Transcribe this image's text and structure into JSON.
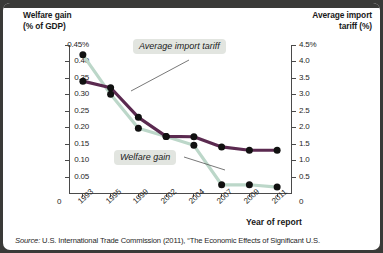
{
  "axes": {
    "left_title": "Welfare gain\n(% of GDP)",
    "left_title_line1": "Welfare gain",
    "left_title_line2": "(% of GDP)",
    "right_title_line1": "Average import",
    "right_title_line2": "tariff (%)",
    "x_title": "Year of report"
  },
  "callouts": {
    "tariff": "Average import tariff",
    "welfare": "Welfare gain"
  },
  "source": {
    "prefix": "Source:",
    "text": " U.S. International Trade Commission (2011), “The Economic Effects of Significant U.S."
  },
  "colors": {
    "tariff_line": "#5b2a50",
    "welfare_line": "#bcd7c9",
    "marker": "#111111",
    "axis": "#4a4a4a",
    "frame": "#3a3a38",
    "callout_bg": "#e2e5e0"
  },
  "chart_data": {
    "type": "line",
    "title": "",
    "xlabel": "Year of report",
    "ylabel": "Welfare gain (% of GDP)",
    "y2label": "Average import tariff (%)",
    "categories": [
      "1993",
      "1995",
      "1999",
      "2002",
      "2004",
      "2007",
      "2009",
      "2011"
    ],
    "ylim": [
      0,
      0.45
    ],
    "y2lim": [
      0,
      4.5
    ],
    "yticks": [
      "0",
      "0.05",
      "0.10",
      "0.15",
      "0.20",
      "0.25",
      "0.30",
      "0.35",
      "0.40",
      "0.45%"
    ],
    "y2ticks": [
      "0",
      "0.5",
      "1.0",
      "1.5",
      "2.0",
      "2.5",
      "3.0",
      "3.5",
      "4.0",
      "4.5%"
    ],
    "grid": false,
    "legend": "annotated-callouts",
    "series": [
      {
        "name": "Welfare gain",
        "axis": "left",
        "color": "#bcd7c9",
        "units": "% of GDP",
        "values": [
          0.42,
          0.3,
          0.197,
          0.172,
          0.145,
          0.025,
          0.025,
          0.018
        ]
      },
      {
        "name": "Average import tariff",
        "axis": "right",
        "color": "#5b2a50",
        "units": "%",
        "values": [
          3.4,
          3.2,
          2.3,
          1.72,
          1.71,
          1.4,
          1.3,
          1.3
        ]
      }
    ]
  }
}
